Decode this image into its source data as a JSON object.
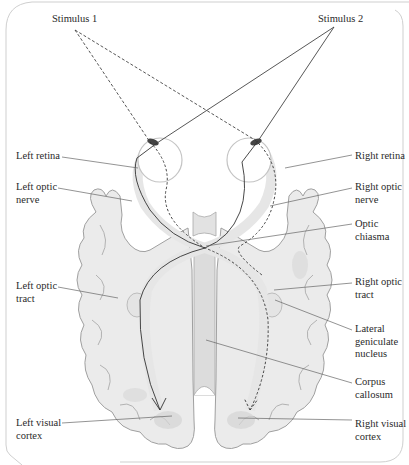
{
  "diagram": {
    "stimuli": [
      {
        "id": "stimulus-1",
        "label": "Stimulus 1",
        "line_style": "dashed"
      },
      {
        "id": "stimulus-2",
        "label": "Stimulus 2",
        "line_style": "solid"
      }
    ],
    "labels_left": [
      {
        "id": "left-retina",
        "text": "Left retina"
      },
      {
        "id": "left-optic-nerve",
        "text": "Left optic\nnerve"
      },
      {
        "id": "left-optic-tract",
        "text": "Left optic\ntract"
      },
      {
        "id": "left-visual-cortex",
        "text": "Left visual\ncortex"
      }
    ],
    "labels_right": [
      {
        "id": "right-retina",
        "text": "Right retina"
      },
      {
        "id": "right-optic-nerve",
        "text": "Right optic\nnerve"
      },
      {
        "id": "optic-chiasma",
        "text": "Optic\nchiasma"
      },
      {
        "id": "right-optic-tract",
        "text": "Right optic\ntract"
      },
      {
        "id": "lateral-geniculate-nucleus",
        "text": "Lateral\ngeniculate\nnucleus"
      },
      {
        "id": "corpus-callosum",
        "text": "Corpus\ncallosum"
      },
      {
        "id": "right-visual-cortex",
        "text": "Right visual\ncortex"
      }
    ],
    "colors": {
      "brain_fill": "#ececec",
      "brain_stroke": "#9a9a9a",
      "leader_line": "#555555",
      "path_line": "#333333",
      "frame": "#c8c8c8"
    }
  }
}
